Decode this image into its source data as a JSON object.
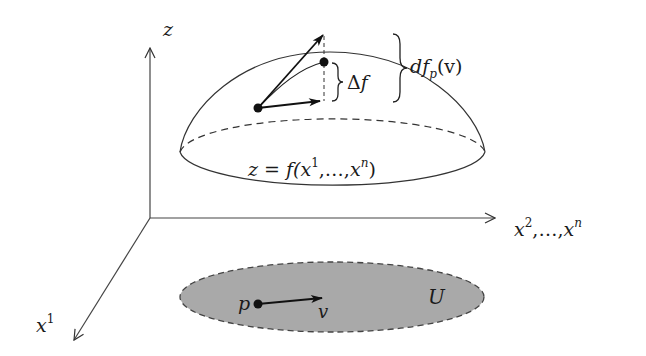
{
  "figure": {
    "type": "differential-of-function-diagram",
    "axes": {
      "vertical": {
        "label": "z"
      },
      "horizontal": {
        "label_base": "x",
        "label_sup_first": "2",
        "label_sep": ",…,",
        "label_sup_last": "n"
      },
      "depth": {
        "label_base": "x",
        "label_sup": "1"
      }
    },
    "surface": {
      "label_prefix": "z = f(",
      "label_x": "x",
      "label_sup_first": "1",
      "label_mid": ",…,",
      "label_sup_last": "n",
      "label_suffix": ")"
    },
    "domain": {
      "label": "U",
      "point_label": "p",
      "vector_label": "v",
      "fill_color": "#a9a9a9"
    },
    "annotations": {
      "delta_f": {
        "symbol": "Δ",
        "var": "f"
      },
      "differential": {
        "d": "d",
        "f": "f",
        "sub": "p",
        "arg": "(v)"
      }
    },
    "colors": {
      "stroke": "#222222",
      "background": "#ffffff"
    }
  }
}
